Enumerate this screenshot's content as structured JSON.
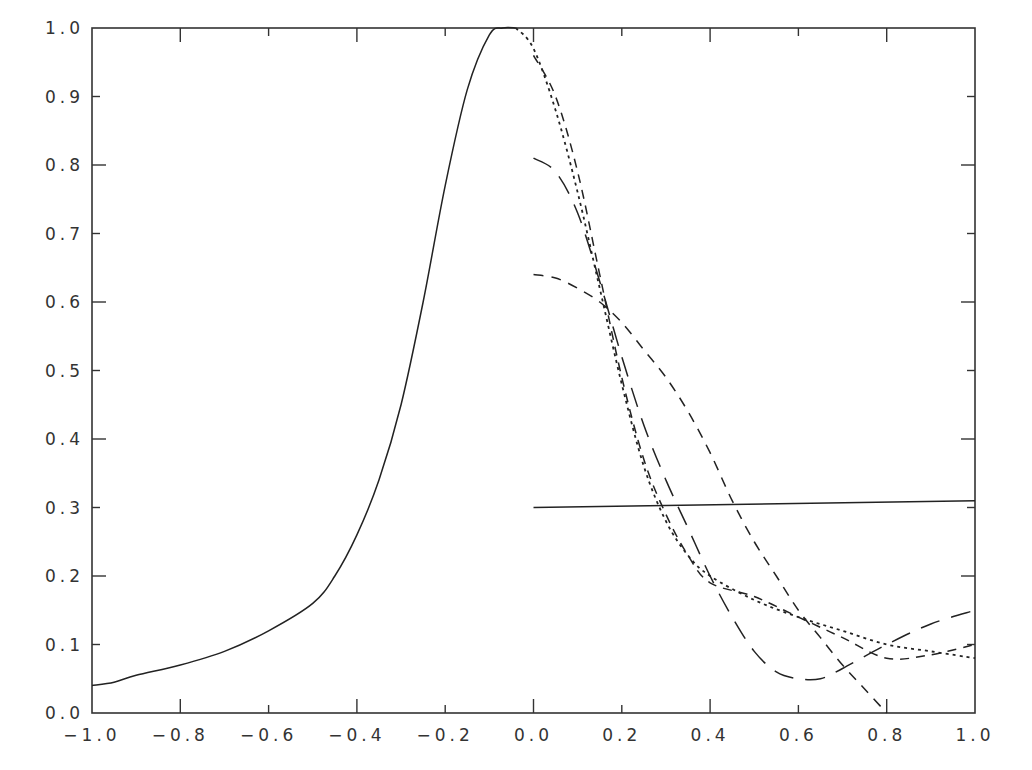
{
  "chart_data": {
    "type": "line",
    "title": "",
    "xlabel": "",
    "ylabel": "",
    "xlim": [
      -1.0,
      1.0
    ],
    "ylim": [
      0.0,
      1.0
    ],
    "grid": false,
    "legend": null,
    "xticks": [
      "-1.0",
      "-0.8",
      "-0.6",
      "-0.4",
      "-0.2",
      "0.0",
      "0.2",
      "0.4",
      "0.6",
      "0.8",
      "1.0"
    ],
    "yticks": [
      "0.0",
      "0.1",
      "0.2",
      "0.3",
      "0.4",
      "0.5",
      "0.6",
      "0.7",
      "0.8",
      "0.9",
      "1.0"
    ],
    "series": [
      {
        "name": "solid peak curve",
        "style": "solid",
        "x": [
          -1.0,
          -0.95,
          -0.9,
          -0.8,
          -0.7,
          -0.6,
          -0.5,
          -0.45,
          -0.4,
          -0.35,
          -0.3,
          -0.25,
          -0.2,
          -0.15,
          -0.1,
          -0.07,
          -0.04
        ],
        "y": [
          0.04,
          0.045,
          0.055,
          0.07,
          0.09,
          0.12,
          0.16,
          0.2,
          0.26,
          0.34,
          0.45,
          0.6,
          0.77,
          0.91,
          0.99,
          1.0,
          1.0
        ]
      },
      {
        "name": "solid horizontal line",
        "style": "solid",
        "x": [
          0.0,
          1.0
        ],
        "y": [
          0.3,
          0.31
        ]
      },
      {
        "name": "dotted curve",
        "style": "dotted",
        "x": [
          -0.04,
          0.0,
          0.05,
          0.1,
          0.15,
          0.2,
          0.25,
          0.3,
          0.35,
          0.4,
          0.5,
          0.6,
          0.7,
          0.8,
          0.9,
          1.0
        ],
        "y": [
          1.0,
          0.97,
          0.88,
          0.76,
          0.62,
          0.48,
          0.36,
          0.28,
          0.23,
          0.2,
          0.165,
          0.14,
          0.12,
          0.1,
          0.09,
          0.08
        ]
      },
      {
        "name": "dash curve 1 (start 0.96)",
        "style": "dashed-short",
        "x": [
          0.0,
          0.05,
          0.1,
          0.15,
          0.2,
          0.25,
          0.3,
          0.35,
          0.4,
          0.5,
          0.6,
          0.7,
          0.8,
          0.9,
          1.0
        ],
        "y": [
          0.96,
          0.9,
          0.79,
          0.64,
          0.49,
          0.37,
          0.29,
          0.23,
          0.19,
          0.17,
          0.14,
          0.11,
          0.08,
          0.085,
          0.1
        ]
      },
      {
        "name": "long-dash curve 2 (start 0.81)",
        "style": "dashed-long",
        "x": [
          0.0,
          0.05,
          0.1,
          0.15,
          0.2,
          0.25,
          0.3,
          0.35,
          0.4,
          0.45,
          0.5,
          0.55,
          0.6,
          0.65,
          0.7,
          0.8,
          0.9,
          1.0
        ],
        "y": [
          0.81,
          0.79,
          0.73,
          0.63,
          0.52,
          0.42,
          0.34,
          0.27,
          0.2,
          0.14,
          0.09,
          0.06,
          0.05,
          0.05,
          0.065,
          0.1,
          0.13,
          0.15
        ]
      },
      {
        "name": "dash curve 3 (start 0.64)",
        "style": "dashed-medium",
        "x": [
          0.0,
          0.05,
          0.1,
          0.15,
          0.2,
          0.25,
          0.3,
          0.35,
          0.4,
          0.45,
          0.5,
          0.55,
          0.6,
          0.65,
          0.7,
          0.75,
          0.8
        ],
        "y": [
          0.64,
          0.635,
          0.62,
          0.6,
          0.57,
          0.53,
          0.49,
          0.44,
          0.38,
          0.31,
          0.25,
          0.2,
          0.15,
          0.11,
          0.07,
          0.035,
          0.0
        ]
      }
    ]
  },
  "axes": {
    "x_tick_labels": [
      "-1.0",
      "-0.8",
      "-0.6",
      "-0.4",
      "-0.2",
      "0.0",
      "0.2",
      "0.4",
      "0.6",
      "0.8",
      "1.0"
    ],
    "y_tick_labels": [
      "0.0",
      "0.1",
      "0.2",
      "0.3",
      "0.4",
      "0.5",
      "0.6",
      "0.7",
      "0.8",
      "0.9",
      "1.0"
    ]
  },
  "colors": {
    "line": "#222222",
    "axis": "#333333",
    "background": "#ffffff"
  }
}
